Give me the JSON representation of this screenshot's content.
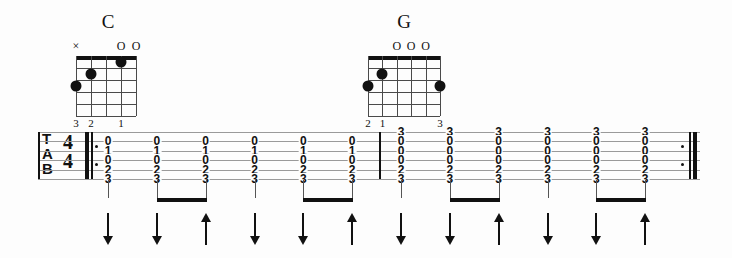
{
  "notation": {
    "clef_label": "TAB",
    "clef_letters": [
      "T",
      "A",
      "B"
    ],
    "time_signature": {
      "numerator": "4",
      "denominator": "4",
      "display": "4/4"
    },
    "string_count": 6,
    "repeat_start": true,
    "repeat_end": true
  },
  "chords": [
    {
      "name": "C",
      "strings_shown": 5,
      "frets_shown": 5,
      "open_marks": [
        {
          "string": 5,
          "symbol": "×",
          "kind": "muted"
        },
        {
          "string": 2,
          "symbol": "O",
          "kind": "open"
        },
        {
          "string": 1,
          "symbol": "O",
          "kind": "open"
        }
      ],
      "dots": [
        {
          "string": 5,
          "fret": 3,
          "finger": "3"
        },
        {
          "string": 4,
          "fret": 2,
          "finger": "2"
        },
        {
          "string": 2,
          "fret": 1,
          "finger": "1"
        }
      ],
      "finger_labels": [
        {
          "string": 5,
          "label": "3"
        },
        {
          "string": 4,
          "label": "2"
        },
        {
          "string": 2,
          "label": "1"
        }
      ]
    },
    {
      "name": "G",
      "strings_shown": 6,
      "frets_shown": 5,
      "open_marks": [
        {
          "string": 4,
          "symbol": "O",
          "kind": "open"
        },
        {
          "string": 3,
          "symbol": "O",
          "kind": "open"
        },
        {
          "string": 2,
          "symbol": "O",
          "kind": "open"
        }
      ],
      "dots": [
        {
          "string": 6,
          "fret": 3,
          "finger": "2"
        },
        {
          "string": 5,
          "fret": 2,
          "finger": "1"
        },
        {
          "string": 1,
          "fret": 3,
          "finger": "3"
        }
      ],
      "finger_labels": [
        {
          "string": 6,
          "label": "2"
        },
        {
          "string": 5,
          "label": "1"
        },
        {
          "string": 1,
          "label": "3"
        }
      ]
    }
  ],
  "measures": [
    {
      "chord": "C",
      "columns": [
        {
          "frets": [
            "",
            "0",
            "1",
            "0",
            "2",
            "3"
          ],
          "strum": "down",
          "duration": "quarter",
          "beam_group": null
        },
        {
          "frets": [
            "",
            "0",
            "1",
            "0",
            "2",
            "3"
          ],
          "strum": "down",
          "duration": "eighth",
          "beam_group": 1
        },
        {
          "frets": [
            "",
            "0",
            "1",
            "0",
            "2",
            "3"
          ],
          "strum": "up",
          "duration": "eighth",
          "beam_group": 1
        },
        {
          "frets": [
            "",
            "0",
            "1",
            "0",
            "2",
            "3"
          ],
          "strum": "down",
          "duration": "quarter",
          "beam_group": null
        },
        {
          "frets": [
            "",
            "0",
            "1",
            "0",
            "2",
            "3"
          ],
          "strum": "down",
          "duration": "eighth",
          "beam_group": 2
        },
        {
          "frets": [
            "",
            "0",
            "1",
            "0",
            "2",
            "3"
          ],
          "strum": "up",
          "duration": "eighth",
          "beam_group": 2
        }
      ]
    },
    {
      "chord": "G",
      "columns": [
        {
          "frets": [
            "3",
            "0",
            "0",
            "0",
            "2",
            "3"
          ],
          "strum": "down",
          "duration": "quarter",
          "beam_group": null
        },
        {
          "frets": [
            "3",
            "0",
            "0",
            "0",
            "2",
            "3"
          ],
          "strum": "down",
          "duration": "eighth",
          "beam_group": 3
        },
        {
          "frets": [
            "3",
            "0",
            "0",
            "0",
            "2",
            "3"
          ],
          "strum": "up",
          "duration": "eighth",
          "beam_group": 3
        },
        {
          "frets": [
            "3",
            "0",
            "0",
            "0",
            "2",
            "3"
          ],
          "strum": "down",
          "duration": "quarter",
          "beam_group": null
        },
        {
          "frets": [
            "3",
            "0",
            "0",
            "0",
            "2",
            "3"
          ],
          "strum": "down",
          "duration": "eighth",
          "beam_group": 4
        },
        {
          "frets": [
            "3",
            "0",
            "0",
            "0",
            "2",
            "3"
          ],
          "strum": "up",
          "duration": "eighth",
          "beam_group": 4
        }
      ]
    }
  ],
  "strum_pattern": {
    "down_symbol": "↓",
    "up_symbol": "↑",
    "sequence": [
      "down",
      "down",
      "up",
      "down",
      "down",
      "up",
      "down",
      "down",
      "up",
      "down",
      "down",
      "up"
    ]
  },
  "colors": {
    "ink": "#111111",
    "staff_line": "#9a9a9a",
    "grid_line": "#4a4a4a",
    "background": "#fdfdfd"
  }
}
